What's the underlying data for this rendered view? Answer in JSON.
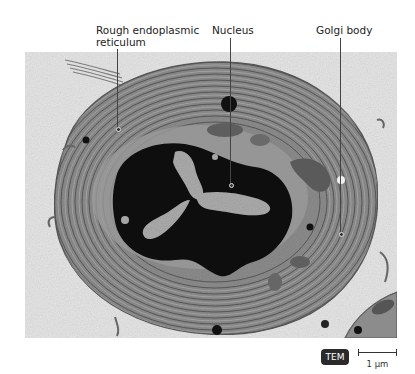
{
  "figure": {
    "labels": [
      {
        "line1": "Rough endoplasmic",
        "line2": "reticulum"
      },
      {
        "line1": "Nucleus"
      },
      {
        "line1": "Golgi body"
      }
    ],
    "badge": "TEM",
    "scale_bar_text": "1 µm",
    "colors": {
      "background_stain": "#e4e4e4",
      "cytoplasm": "#8a8a8a",
      "er_lines": "#5a5a5a",
      "nucleus": "#101010",
      "nucleolus_speckle": "#bdbdbd",
      "badge_bg": "#2a2a2a"
    }
  }
}
